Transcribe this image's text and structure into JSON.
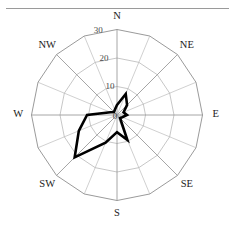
{
  "figure": {
    "title": "",
    "top_rule": true
  },
  "chart_data": {
    "type": "line",
    "subtype": "wind-rose-polar",
    "title": "",
    "xlabel": "",
    "ylabel": "",
    "center": {
      "x": 117,
      "y": 115
    },
    "radius_px": 85.5,
    "rlim": [
      0,
      30
    ],
    "grid": true,
    "legend_position": "none",
    "n_sectors": 16,
    "radial_ticks": [
      10,
      20,
      30
    ],
    "radial_tick_label_angle_deg": 348,
    "compass_labels": [
      "N",
      "NE",
      "E",
      "SE",
      "S",
      "SW",
      "W",
      "NW"
    ],
    "categories": [
      "N",
      "NNE",
      "NE",
      "ENE",
      "E",
      "ESE",
      "SE",
      "SSE",
      "S",
      "SSW",
      "SW",
      "WSW",
      "W",
      "WNW",
      "NW",
      "NNW"
    ],
    "angles_deg": [
      0,
      22.5,
      45,
      67.5,
      90,
      112.5,
      135,
      157.5,
      180,
      202.5,
      225,
      247.5,
      270,
      292.5,
      315,
      337.5
    ],
    "values": [
      3.5,
      8.0,
      5.0,
      2.5,
      3.5,
      2.0,
      1.5,
      9.5,
      6.0,
      10.5,
      21.0,
      14.5,
      10.5,
      2.5,
      1.5,
      2.0
    ],
    "series": [
      {
        "name": "frequency",
        "values": [
          3.5,
          8.0,
          5.0,
          2.5,
          3.5,
          2.0,
          1.5,
          9.5,
          6.0,
          10.5,
          21.0,
          14.5,
          10.5,
          2.5,
          1.5,
          2.0
        ]
      }
    ],
    "line_color": "#000000",
    "line_width": 2.6,
    "grid_color": "#a9a9a9",
    "axis_color": "#8f8f8f",
    "background": "#ffffff"
  }
}
